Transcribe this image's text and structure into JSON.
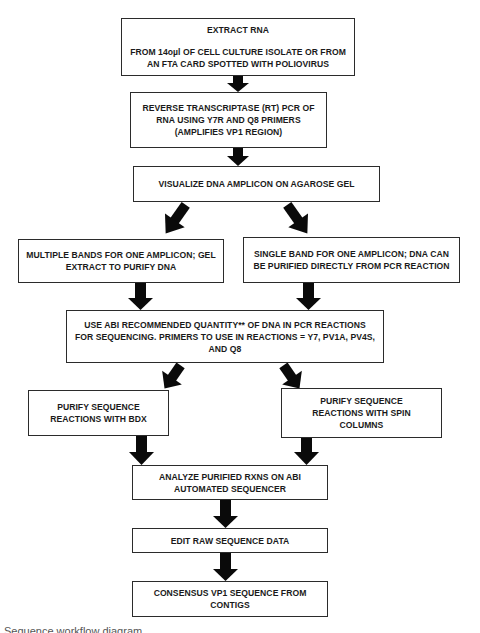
{
  "diagram": {
    "type": "flowchart",
    "steps": {
      "extract_rna": {
        "heading": "EXTRACT RNA",
        "lines": [
          "FROM 14oµl OF CELL CULTURE ISOLATE OR FROM",
          "AN FTA CARD SPOTTED WITH POLIOVIRUS"
        ]
      },
      "rt_pcr": {
        "lines": [
          "REVERSE TRANSCRIPTASE (RT) PCR OF",
          "RNA USING Y7R AND Q8 PRIMERS",
          "(AMPLIFIES VP1 REGION)"
        ]
      },
      "visualize": {
        "lines": [
          "VISUALIZE DNA AMPLICON ON AGAROSE GEL"
        ]
      },
      "multiple_bands": {
        "lines": [
          "MULTIPLE BANDS FOR ONE AMPLICON; GEL",
          "EXTRACT TO PURIFY DNA"
        ]
      },
      "single_band": {
        "lines": [
          "SINGLE BAND FOR ONE AMPLICON; DNA CAN",
          "BE PURIFIED DIRECTLY FROM PCR REACTION"
        ]
      },
      "sequencing_pcr": {
        "lines": [
          "USE ABI RECOMMENDED QUANTITY** OF DNA IN PCR REACTIONS",
          "FOR SEQUENCING.  PRIMERS TO USE IN REACTIONS = Y7, PV1A, PV4S,",
          "AND Q8"
        ]
      },
      "purify_bdx": {
        "lines": [
          "PURIFY SEQUENCE",
          "REACTIONS WITH BDX"
        ]
      },
      "purify_spin": {
        "lines": [
          "PURIFY SEQUENCE",
          "REACTIONS WITH SPIN",
          "COLUMNS"
        ]
      },
      "analyze": {
        "lines": [
          "ANALYZE PURIFIED RXNS ON ABI",
          "AUTOMATED SEQUENCER"
        ]
      },
      "edit": {
        "lines": [
          "EDIT RAW SEQUENCE DATA"
        ]
      },
      "consensus": {
        "lines": [
          "CONSENSUS VP1 SEQUENCE FROM",
          "CONTIGS"
        ]
      }
    },
    "edges": [
      {
        "from": "extract_rna",
        "to": "rt_pcr"
      },
      {
        "from": "rt_pcr",
        "to": "visualize"
      },
      {
        "from": "visualize",
        "to": "multiple_bands"
      },
      {
        "from": "visualize",
        "to": "single_band"
      },
      {
        "from": "multiple_bands",
        "to": "sequencing_pcr"
      },
      {
        "from": "single_band",
        "to": "sequencing_pcr"
      },
      {
        "from": "sequencing_pcr",
        "to": "purify_bdx"
      },
      {
        "from": "sequencing_pcr",
        "to": "purify_spin"
      },
      {
        "from": "purify_bdx",
        "to": "analyze"
      },
      {
        "from": "purify_spin",
        "to": "analyze"
      },
      {
        "from": "analyze",
        "to": "edit"
      },
      {
        "from": "edit",
        "to": "consensus"
      }
    ],
    "colors": {
      "border": "#2b2b2b",
      "arrow": "#0a0a0a",
      "text": "#1a1a1a",
      "background": "#ffffff"
    }
  },
  "caption": "Sequence workflow diagram"
}
